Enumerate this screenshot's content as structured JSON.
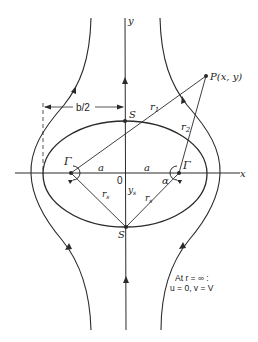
{
  "diagram": {
    "type": "flow-streamlines-around-vortex-pair",
    "axes": {
      "x_label": "x",
      "y_label": "y",
      "origin_label": "0"
    },
    "point_P": {
      "label": "P(x, y)"
    },
    "stagnation_top": {
      "label": "S"
    },
    "stagnation_bottom": {
      "label": "S"
    },
    "vortex_left": {
      "label": "Γ"
    },
    "vortex_right": {
      "label": "Γ"
    },
    "distance_left": {
      "label": "a"
    },
    "distance_right": {
      "label": "a"
    },
    "r1_label": "r",
    "r1_sub": "1",
    "r2_label": "r",
    "r2_sub": "2",
    "rs_left_label": "r",
    "rs_left_sub": "s",
    "rs_right_label": "r",
    "rs_right_sub": "s",
    "ys_label": "y",
    "ys_sub": "s",
    "alpha_label": "α",
    "width_label": "b/2",
    "note_line1": "At r = ∞ :",
    "note_line2": "u = 0, v = V"
  },
  "colors": {
    "line": "#2a2a2a",
    "background": "#ffffff"
  }
}
